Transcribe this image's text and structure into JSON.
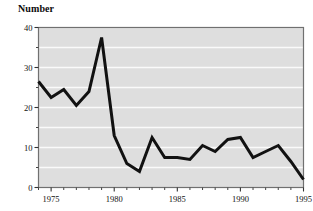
{
  "chart_data": {
    "type": "line",
    "title": "",
    "ylabel": "Number",
    "xlabel": "",
    "xlim": [
      1974,
      1995
    ],
    "ylim": [
      0,
      40
    ],
    "ytick_values": [
      0,
      10,
      20,
      30,
      40
    ],
    "ytick_labels": [
      "0",
      "10",
      "20",
      "30",
      "40"
    ],
    "yminor_values": [
      5,
      15,
      25,
      35
    ],
    "xtick_values": [
      1975,
      1980,
      1985,
      1990,
      1995
    ],
    "xtick_labels": [
      "1975",
      "1980",
      "1985",
      "1990",
      "1995"
    ],
    "xminor_values": [
      1974,
      1976,
      1977,
      1978,
      1979,
      1981,
      1982,
      1983,
      1984,
      1986,
      1987,
      1988,
      1989,
      1991,
      1992,
      1993,
      1994
    ],
    "grid": "horizontal-white",
    "legend": "none",
    "plot_background": "#dedede",
    "gridline_color": "#fafafa",
    "line_color": "#111111",
    "line_width": 3,
    "x": [
      1974,
      1975,
      1976,
      1977,
      1978,
      1979,
      1980,
      1981,
      1982,
      1983,
      1984,
      1985,
      1986,
      1987,
      1988,
      1989,
      1990,
      1991,
      1992,
      1993,
      1994,
      1995
    ],
    "values": [
      26.5,
      22.5,
      24.5,
      20.5,
      24,
      37.5,
      13,
      6,
      4,
      12.5,
      7.5,
      7.5,
      7,
      10.5,
      9,
      12,
      12.5,
      7.5,
      9,
      10.5,
      6.5,
      2
    ],
    "series": [
      {
        "name": "Number",
        "values": [
          26.5,
          22.5,
          24.5,
          20.5,
          24,
          37.5,
          13,
          6,
          4,
          12.5,
          7.5,
          7.5,
          7,
          10.5,
          9,
          12,
          12.5,
          7.5,
          9,
          10.5,
          6.5,
          2
        ]
      }
    ]
  }
}
